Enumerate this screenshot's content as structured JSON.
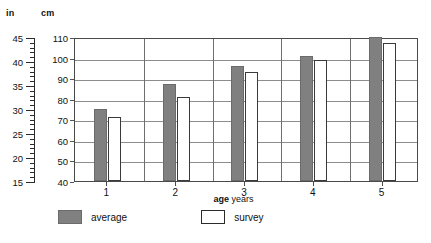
{
  "axes": {
    "left_unit": "in",
    "inner_unit": "cm",
    "x_title_bold": "age",
    "x_title_rest": "years",
    "in_ticks": [
      "45",
      "40",
      "35",
      "30",
      "25",
      "20",
      "15"
    ],
    "cm_ticks": [
      "110",
      "100",
      "90",
      "80",
      "70",
      "60",
      "50",
      "40"
    ]
  },
  "legend": {
    "average_label": "average",
    "survey_label": "survey",
    "average_color": "#808080",
    "survey_color": "#ffffff"
  },
  "chart_data": {
    "type": "bar",
    "title": "",
    "subtitle": "",
    "xlabel": "age years",
    "ylabel": "cm",
    "ylabel_secondary": "in",
    "categories": [
      "1",
      "2",
      "3",
      "4",
      "5"
    ],
    "series": [
      {
        "name": "average",
        "values": [
          75,
          87,
          96,
          101,
          110
        ],
        "color": "#808080"
      },
      {
        "name": "survey",
        "values": [
          71,
          81,
          93,
          99,
          107
        ],
        "color": "#ffffff"
      }
    ],
    "ylim": [
      40,
      110
    ],
    "ylim_secondary": [
      15,
      45
    ],
    "ytick_labels": [
      "40",
      "50",
      "60",
      "70",
      "80",
      "90",
      "100",
      "110"
    ],
    "ytick_labels_secondary": [
      "15",
      "20",
      "25",
      "30",
      "35",
      "40",
      "45"
    ],
    "xtick_labels": [
      "1",
      "2",
      "3",
      "4",
      "5"
    ],
    "grid": true,
    "grid_axis": "y",
    "legend_position": "below-left",
    "annotations": []
  }
}
